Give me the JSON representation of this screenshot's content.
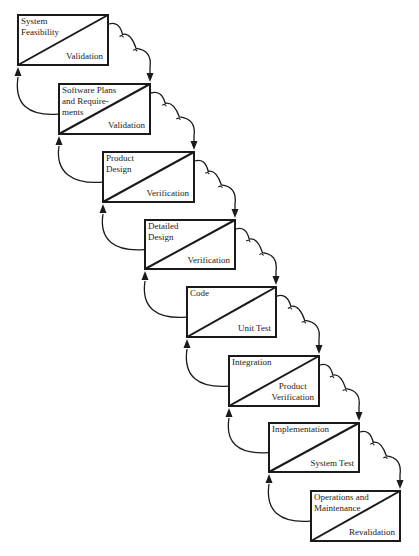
{
  "diagram": {
    "type": "waterfall-model",
    "colors": {
      "line": "#1a1a1a",
      "text": "#222222",
      "background": "#ffffff"
    },
    "stages": [
      {
        "title": "System\nFeasibility",
        "check": "Validation",
        "box": [
          17,
          14,
          92,
          52
        ]
      },
      {
        "title": "Software Plans\nand Require-\nments",
        "check": "Validation",
        "box": [
          58,
          83,
          93,
          52
        ]
      },
      {
        "title": "Product\nDesign",
        "check": "Verification",
        "box": [
          102,
          151,
          93,
          52
        ]
      },
      {
        "title": "Detailed\nDesign",
        "check": "Verification",
        "box": [
          144,
          219,
          92,
          51
        ]
      },
      {
        "title": "Code",
        "check": "Unit Test",
        "box": [
          186,
          286,
          91,
          52
        ]
      },
      {
        "title": "Integration",
        "check": "Product\nVerification",
        "box": [
          228,
          355,
          92,
          52
        ]
      },
      {
        "title": "Implementation",
        "check": "System Test",
        "box": [
          268,
          422,
          92,
          51
        ]
      },
      {
        "title": "Operations and\nMaintenance",
        "check": "Revalidation",
        "box": [
          310,
          490,
          91,
          52
        ]
      }
    ],
    "arrows": {
      "forward": "scalloped curve from upper right of each stage down to top-right corner of next stage",
      "feedback": "curve from left side of each stage up into bottom-left corner of previous stage"
    }
  }
}
